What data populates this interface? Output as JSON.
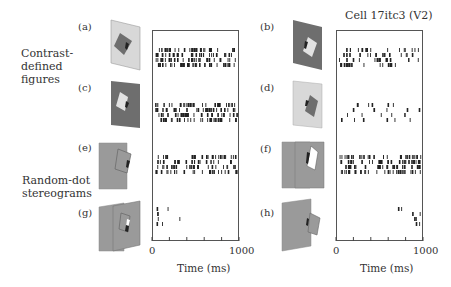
{
  "figure": {
    "cell_title": "Cell 17itc3 (V2)",
    "group_labels": {
      "contrast": [
        "Contrast-",
        "defined",
        "figures"
      ],
      "random_dot": [
        "Random-dot",
        "stereograms"
      ]
    },
    "panel_labels": {
      "a": "(a)",
      "b": "(b)",
      "c": "(c)",
      "d": "(d)",
      "e": "(e)",
      "f": "(f)",
      "g": "(g)",
      "h": "(h)"
    },
    "axes": {
      "left": {
        "tick_min": "0",
        "tick_max": "1000",
        "title": "Time (ms)"
      },
      "right": {
        "tick_min": "0",
        "tick_max": "1000",
        "title": "Time (ms)"
      }
    },
    "colors": {
      "light_gray": "#d8d8d8",
      "dark_gray": "#6e6e6e",
      "mid_gray": "#9a9a9a",
      "white": "#ffffff",
      "spike": "#222222",
      "frame": "#555555"
    }
  },
  "chart_data": {
    "type": "raster",
    "title": "Cell 17itc3 (V2)",
    "xlabel": "Time (ms)",
    "xlim": [
      0,
      1000
    ],
    "panels": [
      {
        "id": "a",
        "condition": "Contrast-defined, dark figure on light background",
        "trials": 4,
        "response": "strong",
        "approx_spike_rate": "high"
      },
      {
        "id": "b",
        "condition": "Contrast-defined, light figure on dark background",
        "trials": 4,
        "response": "moderate",
        "approx_spike_rate": "medium"
      },
      {
        "id": "c",
        "condition": "Contrast-defined, light figure on dark background (left-side)",
        "trials": 4,
        "response": "strong",
        "approx_spike_rate": "high"
      },
      {
        "id": "d",
        "condition": "Contrast-defined, dark figure on light background (right-side)",
        "trials": 4,
        "response": "weak",
        "approx_spike_rate": "low"
      },
      {
        "id": "e",
        "condition": "Random-dot stereogram",
        "trials": 4,
        "response": "moderate-strong",
        "approx_spike_rate": "medium-high"
      },
      {
        "id": "f",
        "condition": "Random-dot stereogram",
        "trials": 4,
        "response": "strong",
        "approx_spike_rate": "high"
      },
      {
        "id": "g",
        "condition": "Random-dot stereogram",
        "trials": 4,
        "response": "very weak",
        "approx_spike_rate": "very low"
      },
      {
        "id": "h",
        "condition": "Random-dot stereogram",
        "trials": 4,
        "response": "very weak",
        "approx_spike_rate": "very low"
      }
    ],
    "xticks": [
      0,
      200,
      400,
      600,
      800,
      1000
    ],
    "xtick_labels_shown": [
      "0",
      "1000"
    ]
  }
}
